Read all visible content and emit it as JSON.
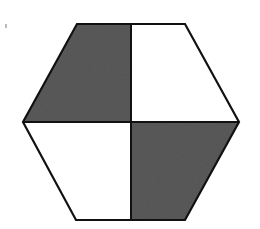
{
  "figure": {
    "shape": "hexagon",
    "colors": {
      "background": "#ffffff",
      "outline": "#111111",
      "shade": "#5a5a5a",
      "unshaded": "#ffffff"
    },
    "vertices": {
      "top_left": [
        77,
        24
      ],
      "top_right": [
        185,
        24
      ],
      "right": [
        239,
        122
      ],
      "bottom_right": [
        185,
        220
      ],
      "bottom_left": [
        76,
        220
      ],
      "left": [
        23,
        122
      ]
    },
    "center": [
      131,
      122
    ],
    "quadrants": [
      {
        "name": "top-left",
        "shaded": true
      },
      {
        "name": "top-right",
        "shaded": false
      },
      {
        "name": "bottom-left",
        "shaded": false
      },
      {
        "name": "bottom-right",
        "shaded": true
      }
    ]
  }
}
